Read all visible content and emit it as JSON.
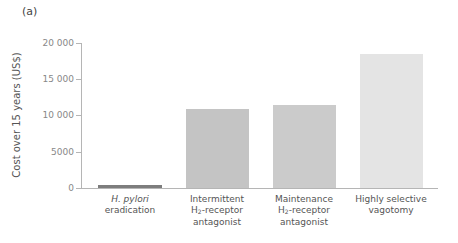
{
  "panel_label": "(a)",
  "chart_data": {
    "type": "bar",
    "title": "",
    "xlabel": "",
    "ylabel": "Cost over 15 years (US$)",
    "ylim": [
      0,
      20000
    ],
    "yticks": [
      0,
      5000,
      10000,
      15000,
      20000
    ],
    "ytick_labels": [
      "0",
      "5000",
      "10 000",
      "15 000",
      "20 000"
    ],
    "categories": [
      "H. pylori eradication",
      "Intermittent H2-receptor antagonist",
      "Maintenance H2-receptor antagonist",
      "Highly selective vagotomy"
    ],
    "values": [
      300,
      10900,
      11450,
      18500
    ],
    "bar_colors": [
      "#7d7d7d",
      "#c4c4c4",
      "#cbcbcb",
      "#e4e4e4"
    ],
    "grid": false,
    "legend": null
  },
  "xlabels": [
    {
      "line1_italic": "H. pylori",
      "line2": "eradication"
    },
    {
      "line1": "Intermittent",
      "line2_pre": "H",
      "line2_sub": "2",
      "line2_post": "-receptor",
      "line3": "antagonist"
    },
    {
      "line1": "Maintenance",
      "line2_pre": "H",
      "line2_sub": "2",
      "line2_post": "-receptor",
      "line3": "antagonist"
    },
    {
      "line1": "Highly selective",
      "line2": "vagotomy"
    }
  ]
}
